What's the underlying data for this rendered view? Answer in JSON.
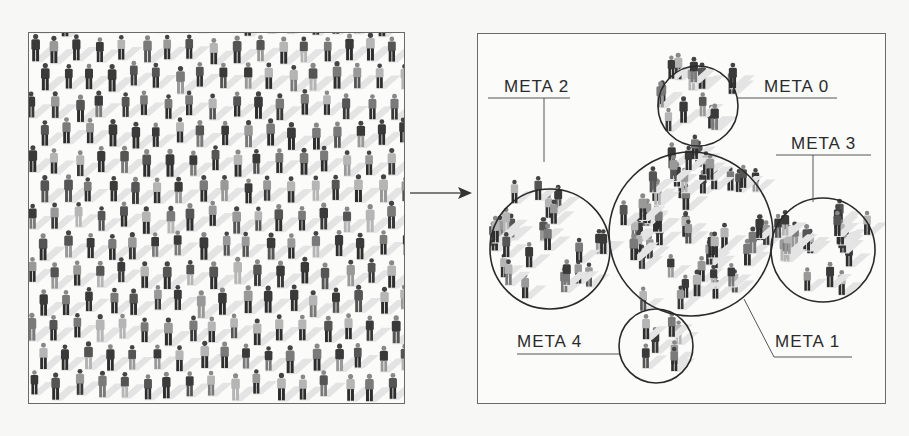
{
  "diagram": {
    "title": "",
    "left_panel": {
      "description": "Dense crowd of people (isometric illustration, grayscale)"
    },
    "arrow": {
      "direction": "right"
    },
    "right_panel": {
      "description": "Crowd grouped into circled clusters",
      "clusters": [
        {
          "id": "meta0",
          "label": "META 0"
        },
        {
          "id": "meta1",
          "label": "META 1"
        },
        {
          "id": "meta2",
          "label": "META 2"
        },
        {
          "id": "meta3",
          "label": "META 3"
        },
        {
          "id": "meta4",
          "label": "META 4"
        }
      ]
    },
    "colors": {
      "background": "#f7f7f6",
      "frame_border": "#6a6a6a",
      "circle_stroke": "#2a2a2a",
      "label_text": "#2a2a2a",
      "figure_dark": "#3a3a3a",
      "figure_mid": "#7a7a7a",
      "figure_light": "#b5b5b5"
    }
  }
}
